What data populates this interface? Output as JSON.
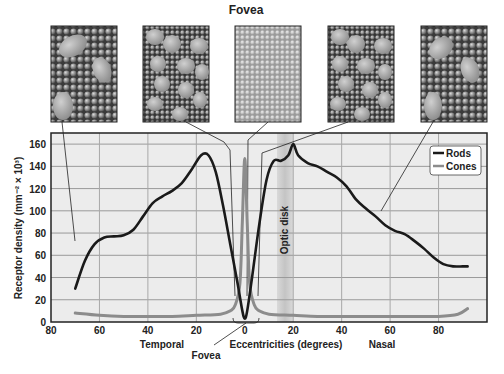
{
  "figure": {
    "top_title": "Fovea",
    "panels": [
      {
        "id": "temporal-far",
        "type": "mixed-large-cones"
      },
      {
        "id": "temporal-near",
        "type": "mixed-many-cones"
      },
      {
        "id": "fovea",
        "type": "cones-only"
      },
      {
        "id": "nasal-near",
        "type": "mixed-many-cones"
      },
      {
        "id": "nasal-far",
        "type": "mixed-large-cones"
      }
    ],
    "annotations": {
      "optic_disk": "Optic disk",
      "fovea_label": "Fovea",
      "temporal": "Temporal",
      "nasal": "Nasal"
    },
    "colors": {
      "rods": "#1a1a1a",
      "cones": "#8c8c8c",
      "optic_disk": "#cfcfcf",
      "plot_bg": "#ececec",
      "grid": "#9a9a9a"
    }
  },
  "chart_data": {
    "type": "line",
    "title": "Fovea",
    "xlabel": "Eccentricities (degrees)",
    "ylabel": "Receptor density (mm⁻² × 10³)",
    "x_tick_labels": [
      "80",
      "60",
      "40",
      "20",
      "0",
      "20",
      "40",
      "60",
      "80"
    ],
    "x_tick_values": [
      -80,
      -60,
      -40,
      -20,
      0,
      20,
      40,
      60,
      80
    ],
    "x_direction_labels": {
      "negative": "Temporal",
      "positive": "Nasal"
    },
    "y_ticks": [
      0,
      20,
      40,
      60,
      80,
      100,
      120,
      140,
      160
    ],
    "xlim": [
      -80,
      100
    ],
    "ylim": [
      0,
      170
    ],
    "grid": true,
    "legend": {
      "position": "upper right",
      "entries": [
        "Rods",
        "Cones"
      ]
    },
    "shaded_region": {
      "label": "Optic disk",
      "x_range": [
        13,
        19
      ]
    },
    "series": [
      {
        "name": "Rods",
        "x": [
          -70,
          -66,
          -62,
          -58,
          -54,
          -50,
          -46,
          -42,
          -38,
          -34,
          -30,
          -26,
          -22,
          -18,
          -15,
          -12,
          -9,
          -6,
          -3,
          -1,
          0,
          1,
          3,
          6,
          9,
          12,
          15,
          18,
          20,
          22,
          26,
          30,
          34,
          38,
          42,
          46,
          50,
          54,
          58,
          62,
          66,
          70,
          74,
          78,
          82,
          86,
          90,
          92
        ],
        "y": [
          30,
          55,
          70,
          76,
          77,
          78,
          83,
          95,
          107,
          113,
          118,
          125,
          137,
          150,
          150,
          135,
          105,
          70,
          35,
          10,
          3,
          10,
          40,
          88,
          128,
          145,
          145,
          150,
          160,
          150,
          143,
          140,
          135,
          130,
          122,
          110,
          102,
          95,
          87,
          82,
          79,
          73,
          66,
          58,
          52,
          50,
          50,
          50
        ]
      },
      {
        "name": "Cones",
        "x": [
          -70,
          -60,
          -50,
          -40,
          -30,
          -20,
          -10,
          -6,
          -4,
          -2,
          -1,
          0,
          1,
          2,
          4,
          6,
          10,
          20,
          30,
          40,
          50,
          60,
          70,
          80,
          88,
          92
        ],
        "y": [
          8,
          6,
          5,
          5,
          5,
          6,
          7,
          10,
          15,
          35,
          90,
          147,
          90,
          35,
          15,
          10,
          7,
          6,
          5,
          5,
          5,
          5,
          5,
          5,
          7,
          12
        ]
      }
    ]
  }
}
